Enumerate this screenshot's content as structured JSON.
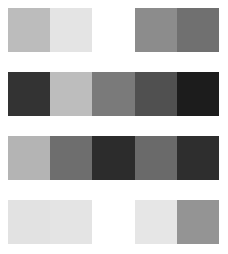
{
  "grid": {
    "rows": [
      {
        "cells": [
          {
            "color": "#bcbcbc"
          },
          {
            "color": "#e4e4e4"
          },
          {
            "color": "#ffffff"
          },
          {
            "color": "#8c8c8c"
          },
          {
            "color": "#707070"
          }
        ]
      },
      {
        "cells": [
          {
            "color": "#333333"
          },
          {
            "color": "#bdbdbd"
          },
          {
            "color": "#7a7a7a"
          },
          {
            "color": "#505050"
          },
          {
            "color": "#1c1c1c"
          }
        ]
      },
      {
        "cells": [
          {
            "color": "#b4b4b4"
          },
          {
            "color": "#6e6e6e"
          },
          {
            "color": "#2c2c2c"
          },
          {
            "color": "#6a6a6a"
          },
          {
            "color": "#2e2e2e"
          }
        ]
      },
      {
        "cells": [
          {
            "color": "#e2e2e2"
          },
          {
            "color": "#e4e4e4"
          },
          {
            "color": "#ffffff"
          },
          {
            "color": "#e6e6e6"
          },
          {
            "color": "#949494"
          }
        ]
      }
    ]
  }
}
